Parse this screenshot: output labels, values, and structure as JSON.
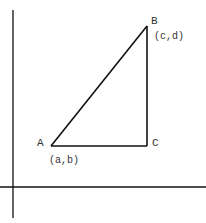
{
  "diagram": {
    "title": "",
    "points": {
      "A": {
        "label": "A",
        "coord_label": "(a,b)"
      },
      "B": {
        "label": "B",
        "coord_label": "(c,d)"
      },
      "C": {
        "label": "C"
      }
    },
    "colors": {
      "line": "#111111",
      "text": "#333333",
      "background": "#ffffff"
    }
  }
}
